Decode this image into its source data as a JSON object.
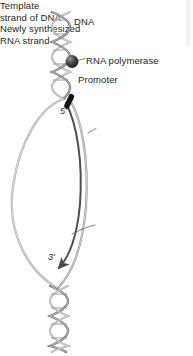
{
  "figure": {
    "background_color": "#ffffff",
    "width": 193,
    "height": 356
  },
  "labels": {
    "dna": "DNA",
    "rna_polymerase": "RNA polymerase",
    "promoter": "Promoter",
    "template_strand_line1": "Template",
    "template_strand_line2": "strand of DNA",
    "new_rna_line1": "Newly synthesized",
    "new_rna_line2": "RNA strand",
    "five_prime": "5'",
    "three_prime": "3'"
  },
  "colors": {
    "text": "#231f20",
    "helix_stroke": "#8d8d8d",
    "helix_stroke_dark": "#5f5f5f",
    "coding_strand": "#a8a8a8",
    "template_strand": "#888888",
    "rna_strand": "#4a4a4a",
    "promoter_bar": "#1a1a1a",
    "polymerase_sphere": "#3a3a3a",
    "polymerase_highlight": "#9a9a9a",
    "leader_line": "#6e6e6e",
    "page_edge": "#e6e6e6"
  },
  "elements": {
    "dna_double_helix_top": "double-helix-ribbon",
    "dna_double_helix_bottom": "double-helix-ribbon",
    "transcription_bubble": "open-loop",
    "polymerase_marker": "filled-sphere",
    "promoter_marker": "filled-bar",
    "rna_arrowhead": "arrow-at-3-prime"
  }
}
